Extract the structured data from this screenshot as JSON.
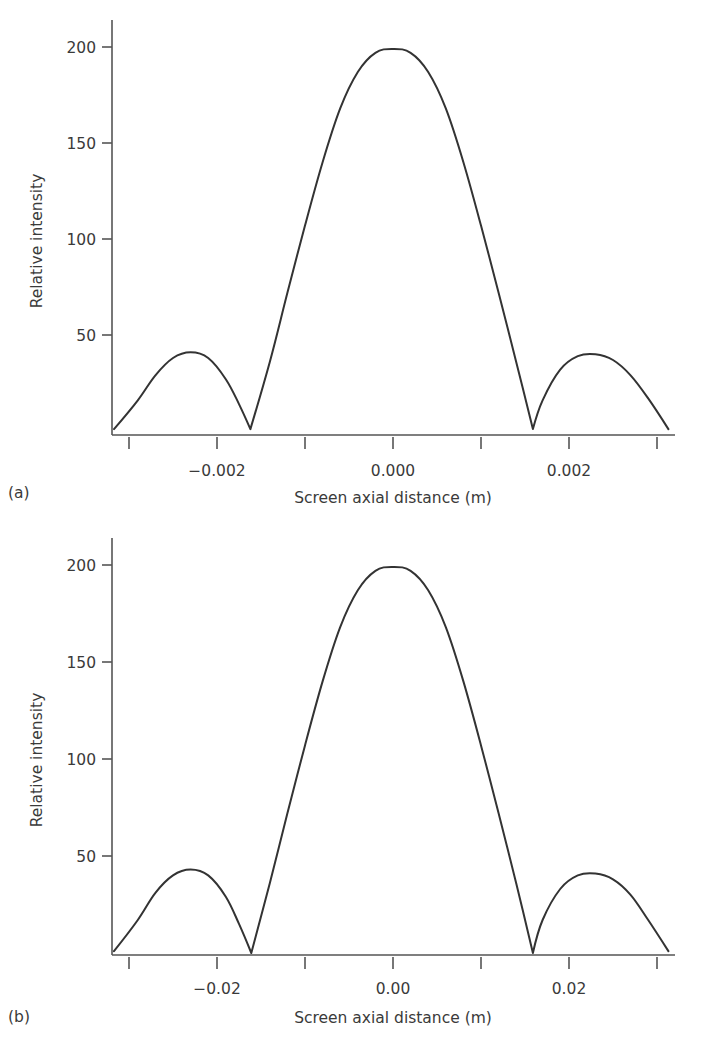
{
  "chart_data": [
    {
      "id": "a",
      "type": "line",
      "panel_label": "(a)",
      "title": "",
      "xlabel": "Screen axial distance (m)",
      "ylabel": "Relative intensity",
      "xlim": [
        -0.0032,
        0.0032
      ],
      "ylim": [
        0,
        215
      ],
      "grid": false,
      "legend": null,
      "x_ticks": [
        -0.003,
        -0.002,
        -0.001,
        0.0,
        0.001,
        0.002,
        0.003
      ],
      "x_tick_labels": [
        "",
        "−0.002",
        "",
        "0.000",
        "",
        "0.002",
        ""
      ],
      "y_ticks": [
        50,
        100,
        150,
        200
      ],
      "y_tick_labels": [
        "50",
        "100",
        "150",
        "200"
      ],
      "series": [
        {
          "name": "intensity",
          "x": [
            -0.00317,
            -0.0029,
            -0.0027,
            -0.0025,
            -0.0023,
            -0.0021,
            -0.0019,
            -0.00175,
            -0.00162,
            -0.0014,
            -0.0012,
            -0.001,
            -0.0008,
            -0.0006,
            -0.0004,
            -0.0002,
            0.0,
            0.0002,
            0.0004,
            0.0006,
            0.0008,
            0.001,
            0.0012,
            0.0014,
            0.00159,
            0.0017,
            0.0019,
            0.0021,
            0.0023,
            0.0025,
            0.0027,
            0.0029,
            0.00313
          ],
          "y": [
            1,
            16,
            29,
            38,
            41,
            38,
            27,
            14,
            1,
            36,
            72,
            107,
            140,
            168,
            187,
            197,
            199,
            197,
            187,
            168,
            140,
            107,
            72,
            36,
            1,
            16,
            32,
            39,
            40,
            37,
            29,
            17,
            1
          ]
        }
      ]
    },
    {
      "id": "b",
      "type": "line",
      "panel_label": "(b)",
      "title": "",
      "xlabel": "Screen axial distance (m)",
      "ylabel": "Relative intensity",
      "xlim": [
        -0.032,
        0.032
      ],
      "ylim": [
        0,
        215
      ],
      "grid": false,
      "legend": null,
      "x_ticks": [
        -0.03,
        -0.02,
        -0.01,
        0.0,
        0.01,
        0.02,
        0.03
      ],
      "x_tick_labels": [
        "",
        "−0.02",
        "",
        "0.00",
        "",
        "0.02",
        ""
      ],
      "y_ticks": [
        50,
        100,
        150,
        200
      ],
      "y_tick_labels": [
        "50",
        "100",
        "150",
        "200"
      ],
      "series": [
        {
          "name": "intensity",
          "x": [
            -0.0317,
            -0.029,
            -0.027,
            -0.025,
            -0.023,
            -0.021,
            -0.019,
            -0.0175,
            -0.0161,
            -0.014,
            -0.012,
            -0.01,
            -0.008,
            -0.006,
            -0.004,
            -0.002,
            0.0,
            0.002,
            0.004,
            0.006,
            0.008,
            0.01,
            0.012,
            0.014,
            0.0159,
            0.017,
            0.019,
            0.021,
            0.023,
            0.025,
            0.027,
            0.029,
            0.0313
          ],
          "y": [
            1,
            17,
            31,
            40,
            43,
            40,
            29,
            15,
            0,
            36,
            72,
            107,
            140,
            168,
            187,
            197,
            199,
            197,
            187,
            168,
            140,
            107,
            72,
            36,
            0,
            17,
            33,
            40,
            41,
            38,
            30,
            17,
            1
          ]
        }
      ]
    }
  ],
  "panels": {
    "a": {
      "label": "(a)",
      "xlabel": "Screen axial distance (m)",
      "ylabel": "Relative intensity"
    },
    "b": {
      "label": "(b)",
      "xlabel": "Screen axial distance (m)",
      "ylabel": "Relative intensity"
    }
  }
}
